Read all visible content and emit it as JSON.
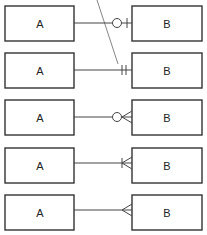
{
  "diagram": {
    "rows": [
      {
        "left": "A",
        "right": "B",
        "notation": "zero-or-one"
      },
      {
        "left": "A",
        "right": "B",
        "notation": "one-and-only-one"
      },
      {
        "left": "A",
        "right": "B",
        "notation": "zero-or-many"
      },
      {
        "left": "A",
        "right": "B",
        "notation": "one-or-many"
      },
      {
        "left": "A",
        "right": "B",
        "notation": "many"
      }
    ],
    "colors": {
      "stroke": "#333333",
      "background": "#ffffff"
    }
  }
}
